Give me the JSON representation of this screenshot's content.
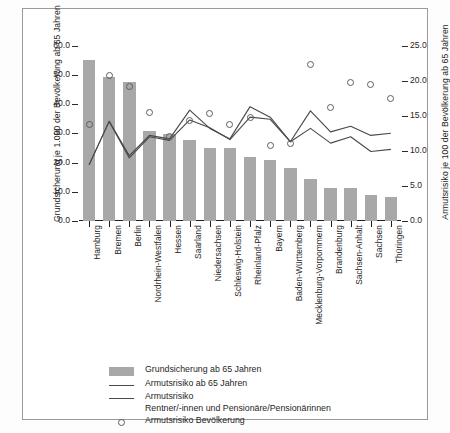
{
  "chart_data": {
    "type": "bar",
    "title": "",
    "subtitle": "",
    "xlabel": "",
    "ylabel": "Grundsicherung je 1.000 der Bevölkerung ab 65 Jahren",
    "y2label": "Armutsrisiko je 100 der Bevölkerung ab 65 Jahren",
    "ylim": [
      0.0,
      65.0
    ],
    "y2lim": [
      0.0,
      27.08
    ],
    "yticks": [
      "0.0",
      "10.0",
      "20.0",
      "30.0",
      "40.0",
      "50.0",
      "60.0"
    ],
    "ytick_values": [
      0.0,
      10.0,
      20.0,
      30.0,
      40.0,
      50.0,
      60.0
    ],
    "y2ticks": [
      "0.0",
      "5.0",
      "10.0",
      "15.0",
      "20.0",
      "25.0"
    ],
    "y2tick_values": [
      0.0,
      5.0,
      10.0,
      15.0,
      20.0,
      25.0
    ],
    "grid": false,
    "legend_position": "below-left",
    "categories": [
      "Hamburg",
      "Bremen",
      "Berlin",
      "Nordrhein-Westfalen",
      "Hessen",
      "Saarland",
      "Niedersachsen",
      "Schleswig-Holstein",
      "Rheinland-Pfalz",
      "Bayern",
      "Baden-Württemberg",
      "Mecklenburg-Vorpommern",
      "Brandenburg",
      "Sachsen-Anhalt",
      "Sachsen",
      "Thüringen"
    ],
    "series": [
      {
        "name": "Grundsicherung ab 65 Jahren",
        "type": "bar",
        "axis": "left",
        "unit": "je 1.000 der Bevölkerung ab 65 Jahren",
        "color": "#a8a8a8",
        "values": [
          55.0,
          49.3,
          47.6,
          30.8,
          29.6,
          27.8,
          25.0,
          24.9,
          21.9,
          21.0,
          18.3,
          14.5,
          11.4,
          11.3,
          8.8,
          8.1
        ]
      },
      {
        "name": "Armutsrisiko ab 65 Jahren",
        "type": "line",
        "axis": "right",
        "unit": "je 100 der Bevölkerung ab 65 Jahren",
        "color": "#4a4a4a",
        "values": [
          8.0,
          14.2,
          9.3,
          12.2,
          11.7,
          15.8,
          13.2,
          11.7,
          16.3,
          14.8,
          11.3,
          15.7,
          12.7,
          13.5,
          12.2,
          12.5
        ]
      },
      {
        "name": "Armutsrisiko Rentner/-innen und Pensionäre/Pensionärinnen",
        "type": "line",
        "axis": "right",
        "unit": "je 100 der Bevölkerung ab 65 Jahren",
        "color": "#4a4a4a",
        "values": [
          8.0,
          14.2,
          9.0,
          12.0,
          11.5,
          14.4,
          13.3,
          11.6,
          14.8,
          14.5,
          11.3,
          13.2,
          11.1,
          12.0,
          9.9,
          10.2
        ]
      },
      {
        "name": "Armutsrisiko Bevölkerung",
        "type": "scatter",
        "axis": "right",
        "unit": "je 100 der Bevölkerung ab 65 Jahren",
        "marker": "open-circle",
        "color": "#5e5e5e",
        "values": [
          13.8,
          20.8,
          19.2,
          15.4,
          12.0,
          14.3,
          15.3,
          13.8,
          14.8,
          10.7,
          11.0,
          22.3,
          16.2,
          19.7,
          19.4,
          17.5
        ]
      }
    ],
    "legend": [
      {
        "key": "swatch",
        "label": "Grundsicherung ab 65 Jahren"
      },
      {
        "key": "line",
        "label": "Armutsrisiko ab 65 Jahren"
      },
      {
        "key": "line",
        "label": "Armutsrisiko",
        "label2": "Rentner/-innen und Pensionäre/Pensionärinnen"
      },
      {
        "key": "circle",
        "label": "Armutsrisiko Bevölkerung"
      }
    ]
  }
}
